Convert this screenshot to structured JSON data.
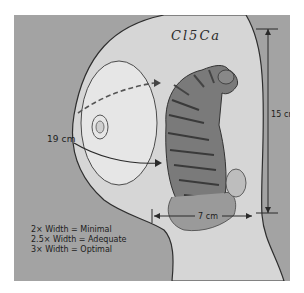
{
  "figure": {
    "tattoo_text": "Cl5Ca",
    "measurements": {
      "arc_label": "19 cm",
      "height_label": "15 cm",
      "width_label": "7 cm"
    },
    "legend": [
      "2× Width = Minimal",
      "2.5× Width = Adequate",
      "3× Width = Optimal"
    ],
    "colors": {
      "background": "#a3a3a3",
      "skin": "#d8d8d8",
      "line": "#2a2a2a"
    }
  }
}
